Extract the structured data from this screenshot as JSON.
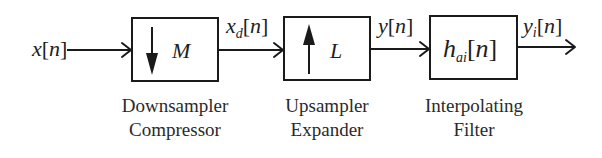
{
  "diagram": {
    "type": "block-diagram",
    "title": "",
    "input_signal": {
      "base": "x",
      "subscript": "",
      "arg": "n"
    },
    "blocks": [
      {
        "id": "downsampler",
        "symbol": "M",
        "icon": "down-arrow-icon",
        "caption_line1": "Downsampler",
        "caption_line2": "Compressor",
        "output_signal": {
          "base": "x",
          "subscript": "d",
          "arg": "n"
        }
      },
      {
        "id": "upsampler",
        "symbol": "L",
        "icon": "up-arrow-icon",
        "caption_line1": "Upsampler",
        "caption_line2": "Expander",
        "output_signal": {
          "base": "y",
          "subscript": "",
          "arg": "n"
        }
      },
      {
        "id": "interpolating-filter",
        "symbol_base": "h",
        "symbol_subscript": "ai",
        "symbol_arg": "n",
        "caption_line1": "Interpolating",
        "caption_line2": "Filter",
        "output_signal": {
          "base": "y",
          "subscript": "i",
          "arg": "n"
        }
      }
    ],
    "brackets": {
      "open": "[",
      "close": "]"
    },
    "colors": {
      "stroke": "#1a1a1a",
      "text": "#1e1e1e",
      "background": "#ffffff"
    }
  }
}
